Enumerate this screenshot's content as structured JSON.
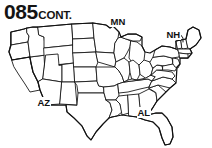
{
  "document": {
    "title_number": "085",
    "title_suffix": "CONT.",
    "scan_artifact_text": ""
  },
  "map": {
    "name": "contiguous-united-states-outline-map",
    "description": "Black and white outline map of the contiguous United States with state borders",
    "stroke_color": "#1a1a1a",
    "fill_color": "#ffffff",
    "background_color": "#ffffff",
    "labels": [
      {
        "id": "mn",
        "text": "MN",
        "state": "Minnesota",
        "has_leader_line": false
      },
      {
        "id": "nh",
        "text": "NH",
        "state": "New Hampshire",
        "has_leader_line": true
      },
      {
        "id": "az",
        "text": "AZ",
        "state": "Arizona",
        "has_leader_line": false
      },
      {
        "id": "al",
        "text": "AL",
        "state": "Alabama",
        "has_leader_line": false
      }
    ]
  }
}
